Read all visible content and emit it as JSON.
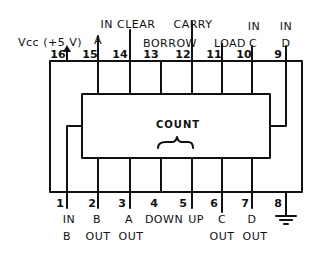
{
  "diagram": {
    "chip_label": "COUNT",
    "top_labels": {
      "vcc": "Vcc (+5 V)",
      "in_clear": "IN CLEAR",
      "a": "A",
      "carry": "CARRY",
      "borrow": "BORROW",
      "load": "LOAD",
      "in_c": "IN",
      "c": "C",
      "in_d": "IN",
      "d": "D"
    },
    "top_pins": [
      {
        "num": "16",
        "x": 67
      },
      {
        "num": "15",
        "x": 98
      },
      {
        "num": "14",
        "x": 130
      },
      {
        "num": "13",
        "x": 161
      },
      {
        "num": "12",
        "x": 192
      },
      {
        "num": "11",
        "x": 222
      },
      {
        "num": "10",
        "x": 252
      },
      {
        "num": "9",
        "x": 286
      }
    ],
    "bottom_pins": [
      {
        "num": "1",
        "x": 67
      },
      {
        "num": "2",
        "x": 98
      },
      {
        "num": "3",
        "x": 130
      },
      {
        "num": "4",
        "x": 161
      },
      {
        "num": "5",
        "x": 192
      },
      {
        "num": "6",
        "x": 222
      },
      {
        "num": "7",
        "x": 252
      },
      {
        "num": "8",
        "x": 286
      }
    ],
    "bottom_labels": {
      "in_b_1": "IN",
      "in_b_2": "B",
      "b_out_1": "B",
      "b_out_2": "OUT",
      "a_out_1": "A",
      "a_out_2": "OUT",
      "down": "DOWN",
      "up": "UP",
      "c_out_1": "C",
      "c_out_2": "OUT",
      "d_out_1": "D",
      "d_out_2": "OUT"
    },
    "ground_symbol": "ground-icon",
    "power_arrow": "arrow-up-icon"
  }
}
